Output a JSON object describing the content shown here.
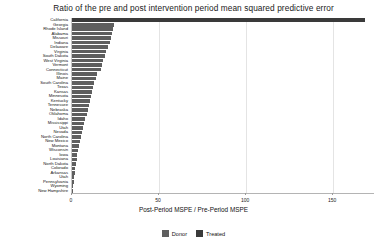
{
  "chart": {
    "title": "Ratio of the pre and post intervention period mean squared predictive error",
    "xlabel": "Post-Period MSPE / Pre-Period MSPE",
    "ylabel": ""
  },
  "legend": {
    "position": "bottom",
    "items": [
      {
        "label": "Donor",
        "color": "#5f5f5f"
      },
      {
        "label": "Treated",
        "color": "#3a3a3a"
      }
    ]
  },
  "axis": {
    "xticks": [
      "0",
      "50",
      "100",
      "150"
    ],
    "xtick_values": [
      0,
      50,
      100,
      150
    ],
    "xlim": [
      0,
      174
    ]
  },
  "chart_data": {
    "type": "bar",
    "orientation": "horizontal",
    "title": "Ratio of the pre and post intervention period mean squared predictive error",
    "xlabel": "Post-Period MSPE / Pre-Period MSPE",
    "ylabel": "",
    "xlim": [
      0,
      174
    ],
    "grid": true,
    "legend_position": "bottom",
    "series": [
      {
        "name": "Treated",
        "color": "#3a3a3a"
      },
      {
        "name": "Donor",
        "color": "#5f5f5f"
      }
    ],
    "categories": [
      "California",
      "Georgia",
      "Rhode Island",
      "Alabama",
      "Missouri",
      "Indiana",
      "Delaware",
      "Virginia",
      "South Dakota",
      "West Virginia",
      "Vermont",
      "Connecticut",
      "Illinois",
      "Maine",
      "South Carolina",
      "Texas",
      "Kansas",
      "Minnesota",
      "Kentucky",
      "Tennessee",
      "Nebraska",
      "Oklahoma",
      "Idaho",
      "Mississippi",
      "Utah",
      "Nevada",
      "North Carolina",
      "New Mexico",
      "Montana",
      "Wisconsin",
      "Iowa",
      "Louisiana",
      "North Dakota",
      "Colorado",
      "Arkansas",
      "Utah",
      "Pennsylvania",
      "Wyoming",
      "New Hampshire"
    ],
    "values": [
      168.0,
      24.0,
      23.5,
      23.0,
      22.4,
      21.6,
      20.6,
      19.6,
      18.8,
      18.0,
      17.2,
      16.6,
      14.4,
      13.6,
      12.8,
      12.2,
      11.6,
      11.0,
      10.4,
      9.8,
      9.0,
      8.4,
      7.6,
      6.9,
      6.2,
      5.6,
      5.0,
      4.5,
      4.0,
      3.5,
      3.0,
      2.6,
      2.2,
      1.8,
      1.5,
      1.2,
      0.9,
      0.6,
      0.3
    ],
    "group": [
      "Treated",
      "Donor",
      "Donor",
      "Donor",
      "Donor",
      "Donor",
      "Donor",
      "Donor",
      "Donor",
      "Donor",
      "Donor",
      "Donor",
      "Donor",
      "Donor",
      "Donor",
      "Donor",
      "Donor",
      "Donor",
      "Donor",
      "Donor",
      "Donor",
      "Donor",
      "Donor",
      "Donor",
      "Donor",
      "Donor",
      "Donor",
      "Donor",
      "Donor",
      "Donor",
      "Donor",
      "Donor",
      "Donor",
      "Donor",
      "Donor",
      "Donor",
      "Donor",
      "Donor",
      "Donor"
    ]
  }
}
